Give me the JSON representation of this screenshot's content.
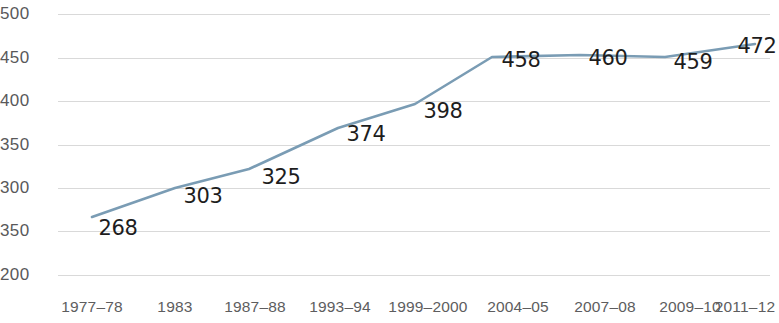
{
  "chart_data": {
    "type": "line",
    "title": "",
    "subtitle": "",
    "xlabel": "",
    "ylabel": "",
    "categories": [
      "1977–78",
      "1983",
      "1987–88",
      "1993–94",
      "1999–2000",
      "2004–05",
      "2007–08",
      "2009–10",
      "2011–12"
    ],
    "values": [
      268,
      303,
      325,
      374,
      398,
      458,
      460,
      459,
      472
    ],
    "series": [
      {
        "name": "",
        "values": [
          268,
          303,
          325,
          374,
          398,
          458,
          460,
          459,
          472
        ]
      }
    ],
    "y_tick_labels": [
      "500",
      "450",
      "400",
      "350",
      "300",
      "350",
      "200"
    ],
    "ylim": [
      200,
      500
    ],
    "grid": true,
    "legend": "none",
    "line_color": "#7a9cb4",
    "data_label_color": "#1d1d1d",
    "axis_label_color": "#5d5d5e",
    "gridline_color": "#d2d2d2"
  },
  "points": [
    {
      "label": "268",
      "x": 92,
      "y": 217,
      "label_x": 118,
      "label_y": 228
    },
    {
      "label": "303",
      "x": 175,
      "y": 188,
      "label_x": 203,
      "label_y": 196
    },
    {
      "label": "325",
      "x": 249,
      "y": 169,
      "label_x": 281,
      "label_y": 177
    },
    {
      "label": "374",
      "x": 338,
      "y": 128,
      "label_x": 366,
      "label_y": 134
    },
    {
      "label": "398",
      "x": 415,
      "y": 104,
      "label_x": 443,
      "label_y": 111
    },
    {
      "label": "458",
      "x": 492,
      "y": 57,
      "label_x": 521,
      "label_y": 60
    },
    {
      "label": "460",
      "x": 580,
      "y": 55,
      "label_x": 608,
      "label_y": 58
    },
    {
      "label": "459",
      "x": 665,
      "y": 57,
      "label_x": 693,
      "label_y": 62
    },
    {
      "label": "472",
      "x": 755,
      "y": 44,
      "label_x": 757,
      "label_y": 46
    }
  ],
  "gridlines": [
    {
      "label": "500",
      "y": 14
    },
    {
      "label": "450",
      "y": 58
    },
    {
      "label": "400",
      "y": 101
    },
    {
      "label": "350",
      "y": 145
    },
    {
      "label": "300",
      "y": 188
    },
    {
      "label": "350",
      "y": 231
    },
    {
      "label": "200",
      "y": 275
    }
  ],
  "x_ticks": [
    {
      "label": "1977–78",
      "x": 92
    },
    {
      "label": "1983",
      "x": 175
    },
    {
      "label": "1987–88",
      "x": 255
    },
    {
      "label": "1993–94",
      "x": 340
    },
    {
      "label": "1999–2000",
      "x": 428
    },
    {
      "label": "2004–05",
      "x": 518
    },
    {
      "label": "2007–08",
      "x": 605
    },
    {
      "label": "2009–10",
      "x": 690
    },
    {
      "label": "2011–12",
      "x": 745
    }
  ]
}
